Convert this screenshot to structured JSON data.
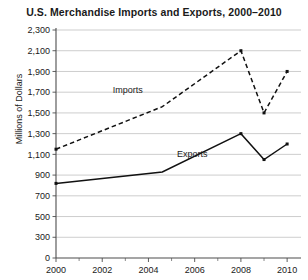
{
  "chart_data": {
    "type": "line",
    "title": "U.S. Merchandise Imports and Exports, 2000–2010",
    "xlabel": "",
    "ylabel": "Millions of Dollars",
    "grid": true,
    "legend_position": "inline-annotation",
    "xlim": [
      2000,
      2010.6
    ],
    "ylim": [
      0,
      2300
    ],
    "x_tick_labels": [
      "2000",
      "2002",
      "2004",
      "2006",
      "2008",
      "2010"
    ],
    "x_tick_values": [
      2000,
      2002,
      2004,
      2006,
      2008,
      2010
    ],
    "x_minor_tick_values": [
      2001,
      2003,
      2005,
      2007,
      2009
    ],
    "y_tick_labels": [
      "0",
      "300",
      "500",
      "700",
      "900",
      "1,100",
      "1,300",
      "1,500",
      "1,700",
      "1,900",
      "2,100",
      "2,300"
    ],
    "y_tick_values": [
      0,
      300,
      500,
      700,
      900,
      1100,
      1300,
      1500,
      1700,
      1900,
      2100,
      2300
    ],
    "series": [
      {
        "name": "Imports",
        "style": "dashed",
        "annotation": "Imports",
        "annotation_x": 2003.1,
        "annotation_y": 1690,
        "x": [
          2000,
          2004.6,
          2008,
          2009,
          2010
        ],
        "values": [
          1150,
          1560,
          2100,
          1500,
          1900
        ]
      },
      {
        "name": "Exports",
        "style": "solid",
        "annotation": "Exports",
        "annotation_x": 2005.9,
        "annotation_y": 1075,
        "x": [
          2000,
          2004.6,
          2008,
          2009,
          2010
        ],
        "values": [
          820,
          930,
          1300,
          1050,
          1200
        ]
      }
    ]
  }
}
